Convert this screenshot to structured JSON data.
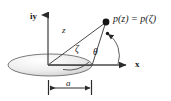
{
  "figure": {
    "background_color": "#ffffff",
    "stroke_color": "#3a3a3a",
    "text_color": "#1a1a1a",
    "disc_fill_light": "#fdfdfd",
    "disc_fill_dark": "#bdbdbd",
    "width": 171,
    "height": 101
  },
  "labels": {
    "vertical_axis": "iy",
    "horizontal_axis": "x",
    "radial_line": "z",
    "projection_line": "ζ",
    "angle": "θ",
    "radius_dimension": "a",
    "point": "p(z) = p(ζ)"
  },
  "geometry": {
    "origin": {
      "x": 48,
      "y": 65
    },
    "vertical_axis_top": {
      "x": 48,
      "y": 10
    },
    "horizontal_axis_end": {
      "x": 130,
      "y": 65
    },
    "point_p": {
      "x": 106,
      "y": 22
    },
    "disc": {
      "cx": 50,
      "cy": 65,
      "rx": 42,
      "ry": 11
    },
    "disc_edge_point": {
      "x": 92,
      "y": 65
    },
    "arc_marker": {
      "x": 107,
      "y": 33
    },
    "dimension_line": {
      "x1": 48,
      "x2": 92,
      "y": 88
    }
  }
}
